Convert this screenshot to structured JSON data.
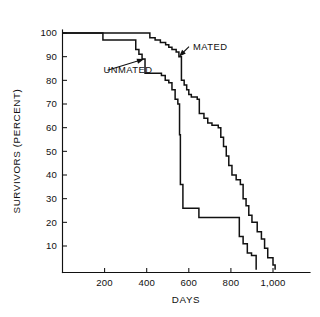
{
  "chart_data": {
    "type": "line",
    "title": "",
    "subtitle": "",
    "xlabel": "DAYS",
    "ylabel": "SURVIVORS (PERCENT)",
    "xlim": [
      0,
      1040
    ],
    "ylim": [
      0,
      100
    ],
    "xticks": [
      200,
      400,
      600,
      800,
      1000
    ],
    "xticklabels": [
      "200",
      "400",
      "600",
      "800",
      "1,000"
    ],
    "yticks": [
      10,
      20,
      30,
      40,
      50,
      60,
      70,
      80,
      90,
      100
    ],
    "yticklabels": [
      "10",
      "20",
      "30",
      "40",
      "50",
      "60",
      "70",
      "80",
      "90",
      "100"
    ],
    "grid": false,
    "legend_position": "inline-annotations",
    "step_style": "post",
    "annotations": [
      {
        "name": "mated-annotation",
        "text": "MATED",
        "text_x": 620,
        "text_y": 93,
        "arrow_tip_x": 553,
        "arrow_tip_y": 90
      },
      {
        "name": "unmated-annotation",
        "text": "UNMATED",
        "text_x": 195,
        "text_y": 83,
        "arrow_tip_x": 388,
        "arrow_tip_y": 89
      }
    ],
    "series": [
      {
        "name": "MATED",
        "color": "#111111",
        "x": [
          0,
          190,
          205,
          340,
          360,
          385,
          400,
          415,
          440,
          465,
          485,
          500,
          520,
          540,
          560,
          565,
          580,
          600,
          615,
          630,
          645,
          660,
          680,
          700,
          715,
          730,
          745,
          760,
          775,
          790,
          805,
          820,
          835,
          850,
          865,
          880,
          895,
          910,
          925,
          940,
          955,
          968,
          980,
          992,
          1000
        ],
        "y": [
          100,
          100,
          100,
          100,
          99,
          98,
          98,
          97,
          96,
          95,
          94,
          93,
          92,
          91,
          90,
          90,
          80,
          78,
          76,
          74,
          73,
          72,
          71,
          70,
          66,
          64,
          62,
          61,
          60,
          56,
          52,
          48,
          44,
          40,
          38,
          36,
          30,
          27,
          23,
          20,
          16,
          13,
          9,
          5,
          0
        ],
        "steps": [
          {
            "day": 0,
            "percent": 100
          },
          {
            "day": 415,
            "percent": 98
          },
          {
            "day": 440,
            "percent": 97
          },
          {
            "day": 465,
            "percent": 96
          },
          {
            "day": 490,
            "percent": 95
          },
          {
            "day": 505,
            "percent": 94
          },
          {
            "day": 520,
            "percent": 93
          },
          {
            "day": 540,
            "percent": 92
          },
          {
            "day": 553,
            "percent": 90
          },
          {
            "day": 565,
            "percent": 80
          },
          {
            "day": 578,
            "percent": 78
          },
          {
            "day": 590,
            "percent": 76
          },
          {
            "day": 600,
            "percent": 74
          },
          {
            "day": 612,
            "percent": 73
          },
          {
            "day": 640,
            "percent": 72
          },
          {
            "day": 650,
            "percent": 66
          },
          {
            "day": 672,
            "percent": 64
          },
          {
            "day": 690,
            "percent": 62
          },
          {
            "day": 710,
            "percent": 61
          },
          {
            "day": 740,
            "percent": 60
          },
          {
            "day": 752,
            "percent": 56
          },
          {
            "day": 765,
            "percent": 52
          },
          {
            "day": 778,
            "percent": 48
          },
          {
            "day": 790,
            "percent": 44
          },
          {
            "day": 805,
            "percent": 40
          },
          {
            "day": 825,
            "percent": 38
          },
          {
            "day": 845,
            "percent": 36
          },
          {
            "day": 858,
            "percent": 30
          },
          {
            "day": 872,
            "percent": 27
          },
          {
            "day": 885,
            "percent": 23
          },
          {
            "day": 900,
            "percent": 20
          },
          {
            "day": 925,
            "percent": 16
          },
          {
            "day": 945,
            "percent": 13
          },
          {
            "day": 960,
            "percent": 9
          },
          {
            "day": 975,
            "percent": 5
          },
          {
            "day": 1000,
            "percent": 2
          },
          {
            "day": 1010,
            "percent": 0
          }
        ]
      },
      {
        "name": "UNMATED",
        "color": "#111111",
        "x": [
          0,
          190,
          210,
          330,
          350,
          365,
          378,
          388,
          400,
          420,
          470,
          490,
          505,
          520,
          535,
          548,
          556,
          560,
          575,
          600,
          640,
          655,
          700,
          760,
          800,
          840,
          860,
          880,
          900,
          915,
          920
        ],
        "y": [
          100,
          100,
          97,
          97,
          93,
          91,
          89,
          89,
          83,
          82,
          82,
          80,
          79,
          76,
          72,
          70,
          57,
          36,
          26,
          26,
          26,
          22,
          22,
          22,
          22,
          14,
          11,
          7,
          6,
          6,
          0
        ],
        "steps": [
          {
            "day": 0,
            "percent": 100
          },
          {
            "day": 192,
            "percent": 97
          },
          {
            "day": 348,
            "percent": 93
          },
          {
            "day": 363,
            "percent": 91
          },
          {
            "day": 378,
            "percent": 89
          },
          {
            "day": 392,
            "percent": 83
          },
          {
            "day": 470,
            "percent": 82
          },
          {
            "day": 488,
            "percent": 80
          },
          {
            "day": 505,
            "percent": 79
          },
          {
            "day": 520,
            "percent": 76
          },
          {
            "day": 535,
            "percent": 72
          },
          {
            "day": 548,
            "percent": 70
          },
          {
            "day": 556,
            "percent": 57
          },
          {
            "day": 560,
            "percent": 36
          },
          {
            "day": 572,
            "percent": 26
          },
          {
            "day": 648,
            "percent": 22
          },
          {
            "day": 840,
            "percent": 14
          },
          {
            "day": 858,
            "percent": 11
          },
          {
            "day": 878,
            "percent": 7
          },
          {
            "day": 898,
            "percent": 6
          },
          {
            "day": 920,
            "percent": 0
          }
        ]
      }
    ]
  },
  "axes": {
    "x_title": "DAYS",
    "y_title": "SURVIVORS (PERCENT)"
  },
  "labels": {
    "mated": "MATED",
    "unmated": "UNMATED"
  }
}
